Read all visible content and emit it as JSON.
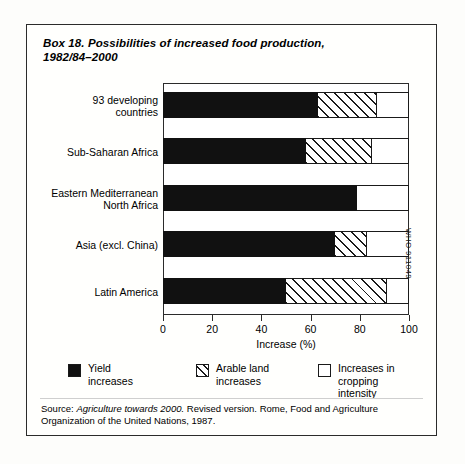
{
  "box": {
    "title_line1": "Box 18. Possibilities of increased food production,",
    "title_line2": "1982/84–2000",
    "who_code": "WHO 911049"
  },
  "chart_data": {
    "type": "bar",
    "orientation": "horizontal",
    "stacked": true,
    "title": "Box 18. Possibilities of increased food production, 1982/84–2000",
    "xlabel": "Increase (%)",
    "ylabel": "",
    "xlim": [
      0,
      100
    ],
    "xticks": [
      0,
      20,
      40,
      60,
      80,
      100
    ],
    "xticklabels": [
      "0",
      "20",
      "40",
      "60",
      "80",
      "100"
    ],
    "grid": false,
    "legend_position": "below-axes",
    "categories": [
      "93 developing countries",
      "Sub-Saharan Africa",
      "Eastern Mediterranean North Africa",
      "Asia (excl. China)",
      "Latin America"
    ],
    "category_labels": [
      [
        "93 developing",
        "countries"
      ],
      [
        "Sub-Saharan Africa"
      ],
      [
        "Eastern Mediterranean",
        "North Africa"
      ],
      [
        "Asia (excl. China)"
      ],
      [
        "Latin America"
      ]
    ],
    "series": [
      {
        "name": "Yield increases",
        "legend_label_lines": [
          "Yield",
          "increases"
        ],
        "fill": "solid-black",
        "values": [
          63,
          58,
          79,
          70,
          50
        ]
      },
      {
        "name": "Arable land increases",
        "legend_label_lines": [
          "Arable land",
          "increases"
        ],
        "fill": "diagonal-hatch",
        "values": [
          24,
          27,
          0,
          13,
          41
        ]
      },
      {
        "name": "Increases in cropping intensity",
        "legend_label_lines": [
          "Increases in",
          "cropping intensity"
        ],
        "fill": "white",
        "values": [
          13,
          15,
          21,
          17,
          9
        ]
      }
    ],
    "totals": [
      100,
      100,
      100,
      100,
      100
    ]
  },
  "source": {
    "prefix": "Source: ",
    "italic_title": "Agriculture towards 2000.",
    "rest": " Revised version. Rome, Food and Agriculture Organization of the United Nations, 1987."
  }
}
